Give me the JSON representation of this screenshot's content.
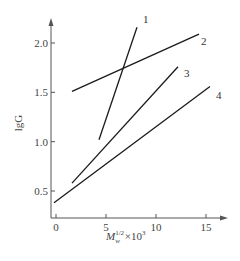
{
  "chart_data": {
    "type": "line",
    "title": "",
    "xlabel": "M_w^(1/2) ×10^3",
    "xlabel_parts": {
      "main": "M",
      "sub": "w",
      "sup": "1/2",
      "suffix": "×10",
      "suffix_sup": "3"
    },
    "ylabel": "lgG",
    "xlim": [
      -0.5,
      17
    ],
    "ylim": [
      0.25,
      2.35
    ],
    "x_ticks": [
      0,
      5,
      10,
      15
    ],
    "x_tick_labels": [
      "0",
      "5",
      "10",
      "15"
    ],
    "y_ticks": [
      0.5,
      1.0,
      1.5,
      2.0
    ],
    "y_tick_labels": [
      "0.5",
      "1.0",
      "1.5",
      "2.0"
    ],
    "grid": false,
    "legend": "inline labels at line ends",
    "series": [
      {
        "name": "1",
        "x": [
          4.3,
          8.1
        ],
        "y": [
          1.02,
          2.16
        ]
      },
      {
        "name": "2",
        "x": [
          1.6,
          14.3
        ],
        "y": [
          1.51,
          2.09
        ]
      },
      {
        "name": "3",
        "x": [
          1.6,
          12.2
        ],
        "y": [
          0.58,
          1.76
        ]
      },
      {
        "name": "4",
        "x": [
          -0.2,
          15.4
        ],
        "y": [
          0.38,
          1.56
        ]
      }
    ]
  },
  "style": {
    "line_color": "#1a1a1a",
    "axis_color": "#555555",
    "text_color": "#444444"
  }
}
